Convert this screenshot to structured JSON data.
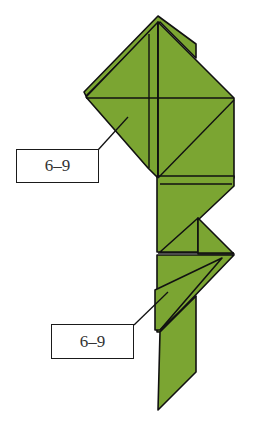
{
  "diagram": {
    "type": "origami-step-diagram",
    "paper_color": "#7BA532",
    "line_color": "#111111",
    "callouts": [
      {
        "id": "upper",
        "label": "6–9"
      },
      {
        "id": "lower",
        "label": "6–9"
      }
    ]
  }
}
